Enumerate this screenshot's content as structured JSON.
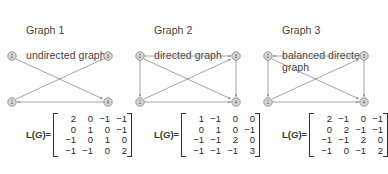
{
  "figure": {
    "panels": [
      {
        "id": "graph-1",
        "title": "Graph 1",
        "subtitle": "undirected graph",
        "matrix_label": "L(G)=",
        "nodes": [
          {
            "id": "2",
            "label": "2",
            "x": 12,
            "y": 8
          },
          {
            "id": "3",
            "label": "3",
            "x": 108,
            "y": 8
          },
          {
            "id": "1",
            "label": "1",
            "x": 12,
            "y": 54
          },
          {
            "id": "4",
            "label": "4",
            "x": 108,
            "y": 54
          }
        ],
        "edges": [
          {
            "from": "2",
            "to": "4",
            "arrow": "end"
          },
          {
            "from": "1",
            "to": "3",
            "arrow": "end"
          },
          {
            "from": "4",
            "to": "1",
            "arrow": "end"
          }
        ],
        "matrix": [
          [
            "2",
            "0",
            "−1",
            "−1"
          ],
          [
            "0",
            "1",
            "0",
            "−1"
          ],
          [
            "−1",
            "0",
            "1",
            "0"
          ],
          [
            "−1",
            "−1",
            "0",
            "2"
          ]
        ]
      },
      {
        "id": "graph-2",
        "title": "Graph 2",
        "subtitle": "directed graph",
        "matrix_label": "L(G)=",
        "nodes": [
          {
            "id": "2",
            "label": "2",
            "x": 12,
            "y": 8
          },
          {
            "id": "3",
            "label": "3",
            "x": 108,
            "y": 8
          },
          {
            "id": "1",
            "label": "1",
            "x": 12,
            "y": 54
          },
          {
            "id": "4",
            "label": "4",
            "x": 108,
            "y": 54
          }
        ],
        "edges": [
          {
            "from": "2",
            "to": "3",
            "arrow": "end"
          },
          {
            "from": "2",
            "to": "1",
            "arrow": "end"
          },
          {
            "from": "2",
            "to": "4",
            "arrow": "end"
          },
          {
            "from": "1",
            "to": "3",
            "arrow": "end"
          },
          {
            "from": "1",
            "to": "4",
            "arrow": "end"
          },
          {
            "from": "3",
            "to": "4",
            "arrow": "end"
          }
        ],
        "matrix": [
          [
            "1",
            "−1",
            "0",
            "0"
          ],
          [
            "0",
            "1",
            "0",
            "−1"
          ],
          [
            "−1",
            "−1",
            "2",
            "0"
          ],
          [
            "−1",
            "−1",
            "−1",
            "3"
          ]
        ]
      },
      {
        "id": "graph-3",
        "title": "Graph 3",
        "subtitle": "balanced directed\ngraph",
        "matrix_label": "L(G)=",
        "nodes": [
          {
            "id": "2",
            "label": "2",
            "x": 12,
            "y": 8
          },
          {
            "id": "3",
            "label": "3",
            "x": 108,
            "y": 8
          },
          {
            "id": "1",
            "label": "1",
            "x": 12,
            "y": 54
          },
          {
            "id": "4",
            "label": "4",
            "x": 108,
            "y": 54
          }
        ],
        "edges": [
          {
            "from": "3",
            "to": "2",
            "arrow": "end"
          },
          {
            "from": "2",
            "to": "1",
            "arrow": "end"
          },
          {
            "from": "2",
            "to": "4",
            "arrow": "end"
          },
          {
            "from": "1",
            "to": "3",
            "arrow": "end"
          },
          {
            "from": "1",
            "to": "4",
            "arrow": "end"
          },
          {
            "from": "3",
            "to": "4",
            "arrow": "end"
          }
        ],
        "matrix": [
          [
            "2",
            "−1",
            "0",
            "−1"
          ],
          [
            "0",
            "2",
            "−1",
            "−1"
          ],
          [
            "−1",
            "−1",
            "2",
            "0"
          ],
          [
            "−1",
            "0",
            "−1",
            "2"
          ]
        ]
      }
    ],
    "colors": {
      "background": "#ffffff",
      "text": "#3f3f3f",
      "edge": "#8d8d8d",
      "node_fill": "#d9d9d9",
      "node_stroke": "#6f6f6f",
      "matrix_text": "#262626"
    }
  }
}
